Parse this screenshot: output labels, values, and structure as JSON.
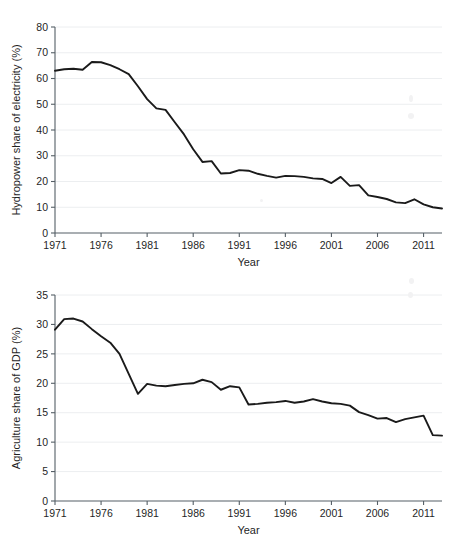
{
  "figure": {
    "background_color": "#ffffff",
    "line_color": "#1a1a1a",
    "grid_color": "#eceef0",
    "axis_color": "#555f66"
  },
  "chart_data": [
    {
      "type": "line",
      "title": "",
      "xlabel": "Year",
      "ylabel": "Hydropower share of electricity (%)",
      "xlim": [
        1971,
        2013
      ],
      "ylim": [
        0,
        80
      ],
      "xticks": [
        1971,
        1976,
        1981,
        1986,
        1991,
        1996,
        2001,
        2006,
        2011
      ],
      "yticks": [
        0,
        10,
        20,
        30,
        40,
        50,
        60,
        70,
        80
      ],
      "grid": "horizontal",
      "legend": "none",
      "x": [
        1971,
        1972,
        1973,
        1974,
        1975,
        1976,
        1977,
        1978,
        1979,
        1980,
        1981,
        1982,
        1983,
        1984,
        1985,
        1986,
        1987,
        1988,
        1989,
        1990,
        1991,
        1992,
        1993,
        1994,
        1995,
        1996,
        1997,
        1998,
        1999,
        2000,
        2001,
        2002,
        2003,
        2004,
        2005,
        2006,
        2007,
        2008,
        2009,
        2010,
        2011,
        2012,
        2013
      ],
      "values": [
        63.0,
        63.6,
        63.8,
        63.4,
        66.4,
        66.3,
        65.2,
        63.6,
        61.7,
        57.0,
        52.0,
        48.4,
        47.8,
        43.0,
        38.3,
        32.5,
        27.6,
        27.9,
        23.1,
        23.3,
        24.4,
        24.2,
        23.0,
        22.2,
        21.5,
        22.2,
        22.1,
        21.8,
        21.2,
        21.0,
        19.4,
        21.8,
        18.3,
        18.6,
        14.6,
        14.0,
        13.2,
        11.9,
        11.6,
        13.1,
        11.1,
        10.0,
        9.5,
        8.7
      ]
    },
    {
      "type": "line",
      "title": "",
      "xlabel": "Year",
      "ylabel": "Agriculture share of GDP (%)",
      "xlim": [
        1971,
        2013
      ],
      "ylim": [
        0,
        35
      ],
      "xticks": [
        1971,
        1976,
        1981,
        1986,
        1991,
        1996,
        2001,
        2006,
        2011
      ],
      "yticks": [
        0,
        5,
        10,
        15,
        20,
        25,
        30,
        35
      ],
      "grid": "horizontal",
      "legend": "none",
      "x": [
        1971,
        1972,
        1973,
        1974,
        1975,
        1976,
        1977,
        1978,
        1979,
        1980,
        1981,
        1982,
        1983,
        1984,
        1985,
        1986,
        1987,
        1988,
        1989,
        1990,
        1991,
        1992,
        1993,
        1994,
        1995,
        1996,
        1997,
        1998,
        1999,
        2000,
        2001,
        2002,
        2003,
        2004,
        2005,
        2006,
        2007,
        2008,
        2009,
        2010,
        2011,
        2012,
        2013
      ],
      "values": [
        29.1,
        30.9,
        31.0,
        30.5,
        29.2,
        28.0,
        26.9,
        25.0,
        21.6,
        18.2,
        19.9,
        19.6,
        19.5,
        19.7,
        19.9,
        20.0,
        20.6,
        20.2,
        18.9,
        19.5,
        19.3,
        16.4,
        16.5,
        16.7,
        16.8,
        17.0,
        16.7,
        16.9,
        17.3,
        16.9,
        16.6,
        16.5,
        16.2,
        15.1,
        14.6,
        14.0,
        14.1,
        13.4,
        13.9,
        14.2,
        14.5,
        11.2,
        11.1
      ]
    }
  ]
}
